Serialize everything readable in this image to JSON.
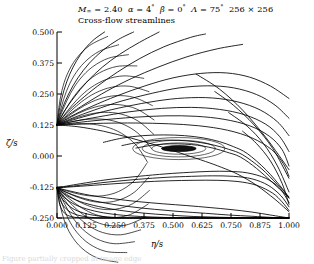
{
  "title": {
    "line1_plain": "M∞ = 2.40   α = 4°   β = 0°   Λ = 75°   256 × 256",
    "line2": "Cross-flow streamlines",
    "mach_symbol": "M",
    "mach_sub": "∞",
    "mach_value": "= 2.40",
    "alpha_symbol": "α",
    "alpha_value": "= 4",
    "beta_symbol": "β",
    "beta_value": "= 0",
    "lambda_symbol": "Λ",
    "lambda_value": "= 75",
    "degree": "°",
    "grid": "256 × 256"
  },
  "axes": {
    "xlabel": "η/s",
    "ylabel": "ζ/s",
    "xticks": [
      "0.000",
      "0.125",
      "0.250",
      "0.375",
      "0.500",
      "0.625",
      "0.750",
      "0.875",
      "1.000"
    ],
    "yticks": [
      "0.500",
      "0.375",
      "0.250",
      "0.125",
      "0.000",
      "-0.125",
      "-0.250"
    ]
  },
  "caption": {
    "text": "Figure partially cropped at image edge"
  },
  "colors": {
    "line": "#000000",
    "axis": "#000000",
    "background": "#ffffff",
    "vortex_core": "#101010"
  },
  "chart_data": {
    "type": "line",
    "title": "Cross-flow streamlines",
    "xlabel": "η/s",
    "ylabel": "ζ/s",
    "xlim": [
      0.0,
      1.0
    ],
    "ylim": [
      -0.25,
      0.5
    ],
    "grid": false,
    "legend": null,
    "annotations": [
      {
        "name": "attachment-node",
        "x": 0.0,
        "y": 0.125,
        "note": "streamline convergence node on left symmetry axis"
      },
      {
        "name": "vortex-core-focus",
        "x": 0.525,
        "y": 0.03,
        "note": "dark filled elliptical vortex core",
        "rx": 0.075,
        "ry": 0.012
      },
      {
        "name": "lower-node",
        "x": 0.0,
        "y": -0.128,
        "note": "lower streamline fan origin on left axis"
      },
      {
        "name": "corner-convergence",
        "x": 1.0,
        "y": -0.25,
        "note": "streamlines converge at lower-right corner"
      }
    ],
    "series": [
      {
        "name": "upper-fan-1",
        "x": [
          0.0,
          0.012,
          0.03,
          0.055,
          0.085,
          0.12,
          0.16,
          0.205
        ],
        "y": [
          0.125,
          0.195,
          0.265,
          0.33,
          0.385,
          0.432,
          0.47,
          0.5
        ]
      },
      {
        "name": "upper-fan-2",
        "x": [
          0.0,
          0.02,
          0.05,
          0.09,
          0.14,
          0.2,
          0.265,
          0.33
        ],
        "y": [
          0.125,
          0.185,
          0.25,
          0.315,
          0.375,
          0.428,
          0.47,
          0.5
        ]
      },
      {
        "name": "upper-fan-3",
        "x": [
          0.0,
          0.03,
          0.075,
          0.13,
          0.195,
          0.27,
          0.355,
          0.44
        ],
        "y": [
          0.125,
          0.178,
          0.238,
          0.3,
          0.358,
          0.41,
          0.458,
          0.5
        ]
      },
      {
        "name": "upper-fan-4",
        "x": [
          0.0,
          0.04,
          0.1,
          0.175,
          0.26,
          0.355,
          0.46,
          0.575,
          0.64
        ],
        "y": [
          0.125,
          0.172,
          0.225,
          0.282,
          0.338,
          0.392,
          0.44,
          0.478,
          0.492
        ]
      },
      {
        "name": "upper-fan-5",
        "x": [
          0.0,
          0.05,
          0.125,
          0.215,
          0.32,
          0.435,
          0.56,
          0.69,
          0.8
        ],
        "y": [
          0.125,
          0.166,
          0.212,
          0.262,
          0.312,
          0.358,
          0.4,
          0.432,
          0.45
        ]
      },
      {
        "name": "arc-1",
        "x": [
          0.0,
          0.06,
          0.15,
          0.26,
          0.38,
          0.5,
          0.62,
          0.73,
          0.83,
          0.92,
          1.0
        ],
        "y": [
          0.125,
          0.16,
          0.2,
          0.243,
          0.283,
          0.315,
          0.333,
          0.335,
          0.318,
          0.282,
          0.232
        ]
      },
      {
        "name": "arc-2",
        "x": [
          0.0,
          0.065,
          0.16,
          0.28,
          0.41,
          0.53,
          0.65,
          0.76,
          0.86,
          0.94,
          1.0
        ],
        "y": [
          0.125,
          0.152,
          0.185,
          0.222,
          0.253,
          0.275,
          0.283,
          0.275,
          0.248,
          0.205,
          0.152
        ]
      },
      {
        "name": "arc-3",
        "x": [
          0.0,
          0.07,
          0.17,
          0.3,
          0.43,
          0.55,
          0.67,
          0.78,
          0.875,
          0.95,
          1.0
        ],
        "y": [
          0.125,
          0.146,
          0.172,
          0.2,
          0.222,
          0.234,
          0.234,
          0.218,
          0.186,
          0.138,
          0.082
        ]
      },
      {
        "name": "arc-4",
        "x": [
          0.0,
          0.075,
          0.18,
          0.31,
          0.45,
          0.58,
          0.7,
          0.81,
          0.9,
          0.96,
          1.0
        ],
        "y": [
          0.125,
          0.14,
          0.158,
          0.178,
          0.192,
          0.196,
          0.188,
          0.166,
          0.128,
          0.078,
          0.018
        ]
      },
      {
        "name": "arc-5",
        "x": [
          0.0,
          0.08,
          0.19,
          0.33,
          0.47,
          0.6,
          0.72,
          0.83,
          0.915,
          0.97,
          1.0
        ],
        "y": [
          0.125,
          0.134,
          0.145,
          0.156,
          0.162,
          0.16,
          0.148,
          0.122,
          0.08,
          0.026,
          -0.04
        ]
      },
      {
        "name": "arc-6-over-vortex",
        "x": [
          0.0,
          0.085,
          0.2,
          0.34,
          0.48,
          0.61,
          0.735,
          0.84,
          0.925,
          0.975,
          1.0
        ],
        "y": [
          0.125,
          0.128,
          0.132,
          0.133,
          0.13,
          0.122,
          0.104,
          0.073,
          0.026,
          -0.03,
          -0.082
        ]
      },
      {
        "name": "bubble-outer",
        "x": [
          0.2,
          0.28,
          0.37,
          0.46,
          0.55,
          0.63,
          0.7,
          0.76,
          0.82,
          0.9,
          0.97,
          1.0
        ],
        "y": [
          0.055,
          0.072,
          0.082,
          0.085,
          0.082,
          0.073,
          0.058,
          0.038,
          0.01,
          -0.055,
          -0.13,
          -0.17
        ]
      },
      {
        "name": "bubble-mid",
        "x": [
          0.28,
          0.35,
          0.42,
          0.49,
          0.56,
          0.62,
          0.68,
          0.74,
          0.8,
          0.88,
          0.95,
          1.0
        ],
        "y": [
          0.042,
          0.055,
          0.062,
          0.064,
          0.061,
          0.054,
          0.043,
          0.027,
          0.005,
          -0.05,
          -0.115,
          -0.165
        ]
      },
      {
        "name": "bubble-inner",
        "x": [
          0.34,
          0.4,
          0.46,
          0.52,
          0.58,
          0.63,
          0.68,
          0.73,
          0.79,
          0.86,
          0.93,
          1.0
        ],
        "y": [
          0.032,
          0.042,
          0.048,
          0.049,
          0.046,
          0.04,
          0.03,
          0.016,
          -0.004,
          -0.05,
          -0.108,
          -0.168
        ]
      },
      {
        "name": "separation-line",
        "x": [
          0.0,
          0.09,
          0.2,
          0.32,
          0.44,
          0.55,
          0.64,
          0.71,
          0.78,
          0.86,
          0.94,
          1.0
        ],
        "y": [
          0.125,
          0.118,
          0.1,
          0.072,
          0.04,
          0.006,
          -0.022,
          -0.046,
          -0.074,
          -0.118,
          -0.175,
          -0.225
        ]
      },
      {
        "name": "lower-band-1",
        "x": [
          0.0,
          0.1,
          0.22,
          0.35,
          0.47,
          0.57,
          0.66,
          0.74,
          0.82,
          0.9,
          0.96,
          1.0
        ],
        "y": [
          -0.128,
          -0.112,
          -0.095,
          -0.082,
          -0.072,
          -0.066,
          -0.062,
          -0.062,
          -0.068,
          -0.09,
          -0.13,
          -0.188
        ]
      },
      {
        "name": "lower-band-2",
        "x": [
          0.0,
          0.1,
          0.22,
          0.35,
          0.47,
          0.58,
          0.67,
          0.76,
          0.84,
          0.91,
          0.965,
          1.0
        ],
        "y": [
          -0.128,
          -0.118,
          -0.105,
          -0.094,
          -0.086,
          -0.082,
          -0.08,
          -0.082,
          -0.092,
          -0.118,
          -0.16,
          -0.205
        ]
      },
      {
        "name": "lower-band-3",
        "x": [
          0.0,
          0.1,
          0.23,
          0.36,
          0.48,
          0.59,
          0.69,
          0.78,
          0.86,
          0.93,
          0.97,
          1.0
        ],
        "y": [
          -0.128,
          -0.122,
          -0.113,
          -0.105,
          -0.1,
          -0.098,
          -0.098,
          -0.103,
          -0.118,
          -0.15,
          -0.185,
          -0.22
        ]
      },
      {
        "name": "lower-fan-1",
        "x": [
          0.0,
          0.06,
          0.14,
          0.24,
          0.35,
          0.46,
          0.56,
          0.66,
          0.75,
          0.84,
          0.92,
          1.0
        ],
        "y": [
          -0.128,
          -0.142,
          -0.158,
          -0.172,
          -0.184,
          -0.193,
          -0.2,
          -0.208,
          -0.216,
          -0.226,
          -0.238,
          -0.25
        ]
      },
      {
        "name": "lower-fan-2",
        "x": [
          0.0,
          0.05,
          0.12,
          0.21,
          0.31,
          0.42,
          0.53,
          0.64,
          0.74,
          0.84,
          0.93,
          1.0
        ],
        "y": [
          -0.128,
          -0.15,
          -0.172,
          -0.19,
          -0.204,
          -0.215,
          -0.224,
          -0.231,
          -0.238,
          -0.243,
          -0.248,
          -0.25
        ]
      },
      {
        "name": "lower-fan-3",
        "x": [
          0.0,
          0.04,
          0.1,
          0.18,
          0.27,
          0.37,
          0.48,
          0.59,
          0.7,
          0.81,
          0.91,
          1.0
        ],
        "y": [
          -0.128,
          -0.158,
          -0.184,
          -0.204,
          -0.219,
          -0.23,
          -0.238,
          -0.244,
          -0.247,
          -0.249,
          -0.25,
          -0.25
        ]
      },
      {
        "name": "lower-fan-4",
        "x": [
          0.0,
          0.03,
          0.08,
          0.145,
          0.22,
          0.31,
          0.41,
          0.52,
          0.64,
          0.76,
          0.88,
          1.0
        ],
        "y": [
          -0.128,
          -0.166,
          -0.197,
          -0.218,
          -0.232,
          -0.241,
          -0.246,
          -0.249,
          -0.25,
          -0.25,
          -0.25,
          -0.25
        ]
      },
      {
        "name": "lower-fan-5",
        "x": [
          0.0,
          0.025,
          0.065,
          0.115,
          0.18,
          0.255,
          0.34,
          0.44,
          0.55,
          0.68,
          0.84,
          1.0
        ],
        "y": [
          -0.128,
          -0.176,
          -0.21,
          -0.23,
          -0.242,
          -0.248,
          -0.25,
          -0.25,
          -0.25,
          -0.25,
          -0.25,
          -0.25
        ]
      },
      {
        "name": "lower-fan-6",
        "x": [
          0.0,
          0.018,
          0.048,
          0.088,
          0.14,
          0.2,
          0.27,
          0.35,
          0.45,
          0.58,
          0.76,
          1.0
        ],
        "y": [
          -0.128,
          -0.186,
          -0.22,
          -0.238,
          -0.247,
          -0.25,
          -0.25,
          -0.25,
          -0.25,
          -0.25,
          -0.25,
          -0.25
        ]
      },
      {
        "name": "lower-fan-7",
        "x": [
          0.0,
          0.012,
          0.032,
          0.06,
          0.095,
          0.14,
          0.19,
          0.25,
          0.33,
          0.45,
          0.65,
          1.0
        ],
        "y": [
          -0.128,
          -0.196,
          -0.23,
          -0.244,
          -0.249,
          -0.25,
          -0.25,
          -0.25,
          -0.25,
          -0.25,
          -0.25,
          -0.25
        ]
      },
      {
        "name": "corner-ray-1",
        "x": [
          0.6,
          0.7,
          0.8,
          0.9,
          1.0
        ],
        "y": [
          0.33,
          0.27,
          0.185,
          0.075,
          -0.055
        ]
      },
      {
        "name": "corner-ray-2",
        "x": [
          0.68,
          0.76,
          0.85,
          0.93,
          1.0
        ],
        "y": [
          0.26,
          0.205,
          0.125,
          0.03,
          -0.09
        ]
      },
      {
        "name": "corner-ray-3",
        "x": [
          0.74,
          0.82,
          0.89,
          0.95,
          1.0
        ],
        "y": [
          0.175,
          0.12,
          0.05,
          -0.04,
          -0.145
        ]
      },
      {
        "name": "corner-ray-4",
        "x": [
          0.8,
          0.86,
          0.92,
          0.97,
          1.0
        ],
        "y": [
          0.1,
          0.05,
          -0.02,
          -0.11,
          -0.195
        ]
      }
    ]
  }
}
